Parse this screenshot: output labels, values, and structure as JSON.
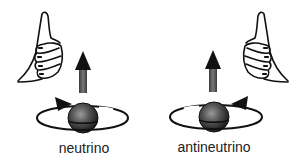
{
  "diagram": {
    "panels": [
      {
        "id": "neutrino",
        "label": "neutrino",
        "hand": "right-hand-thumbs-up",
        "spin_direction": "clockwise-viewed-from-front (arrow on left side pointing right)",
        "momentum_arrow": "up"
      },
      {
        "id": "antineutrino",
        "label": "antineutrino",
        "hand": "left-hand-thumbs-up",
        "spin_direction": "counterclockwise (arrow on right side pointing left)",
        "momentum_arrow": "up"
      }
    ],
    "colors": {
      "line": "#111111",
      "arrow_head": "#111111",
      "arrow_shaft": "#6a6a6a",
      "sphere_dark": "#1e1e1e",
      "sphere_light": "#8a8a8a",
      "background": "#ffffff"
    }
  }
}
